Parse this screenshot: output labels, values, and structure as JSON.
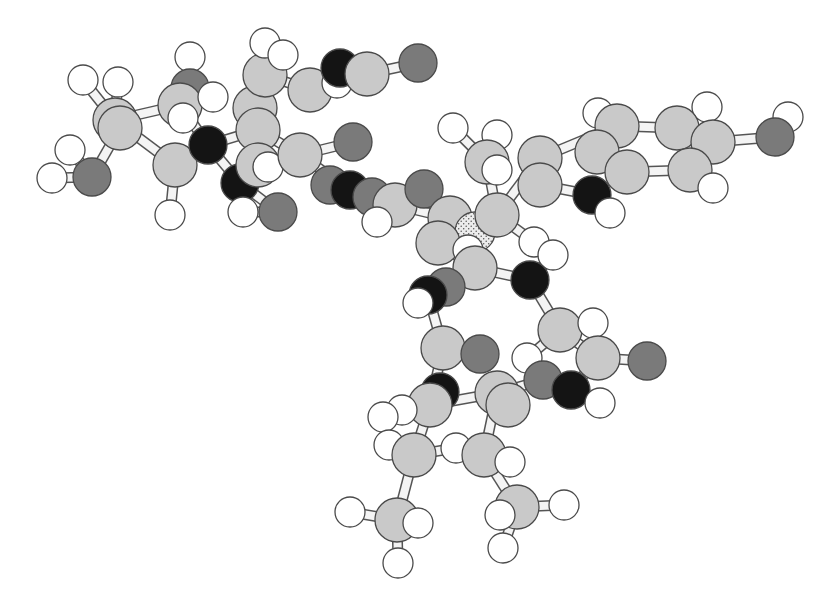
{
  "figure": {
    "type": "ball-and-stick molecular model",
    "background": "#ffffff",
    "element_styles": {
      "C": {
        "fill": "#c9c9c9",
        "r": 22,
        "label": "carbon"
      },
      "H": {
        "fill": "#ffffff",
        "r": 15,
        "label": "hydrogen"
      },
      "O": {
        "fill": "#7a7a7a",
        "r": 19,
        "label": "oxygen"
      },
      "N": {
        "fill": "#141414",
        "r": 19,
        "label": "nitrogen"
      },
      "P": {
        "fill": "#e2e2e2",
        "r": 20,
        "label": "phosphorus (stippled)",
        "pattern": "stipple"
      }
    },
    "bond_style": {
      "outer": "#555555",
      "inner": "#f4f4f4",
      "width": 11
    },
    "atoms": [
      {
        "id": 0,
        "el": "H",
        "x": 83,
        "y": 80
      },
      {
        "id": 1,
        "el": "H",
        "x": 118,
        "y": 82
      },
      {
        "id": 2,
        "el": "C",
        "x": 115,
        "y": 120
      },
      {
        "id": 3,
        "el": "C",
        "x": 120,
        "y": 128
      },
      {
        "id": 4,
        "el": "H",
        "x": 70,
        "y": 150
      },
      {
        "id": 5,
        "el": "O",
        "x": 92,
        "y": 177
      },
      {
        "id": 6,
        "el": "H",
        "x": 52,
        "y": 178
      },
      {
        "id": 7,
        "el": "C",
        "x": 175,
        "y": 165
      },
      {
        "id": 8,
        "el": "H",
        "x": 170,
        "y": 215
      },
      {
        "id": 9,
        "el": "H",
        "x": 190,
        "y": 57
      },
      {
        "id": 10,
        "el": "O",
        "x": 190,
        "y": 88
      },
      {
        "id": 11,
        "el": "C",
        "x": 180,
        "y": 105
      },
      {
        "id": 12,
        "el": "H",
        "x": 183,
        "y": 118
      },
      {
        "id": 13,
        "el": "H",
        "x": 213,
        "y": 97
      },
      {
        "id": 14,
        "el": "N",
        "x": 208,
        "y": 145
      },
      {
        "id": 15,
        "el": "N",
        "x": 240,
        "y": 183
      },
      {
        "id": 16,
        "el": "O",
        "x": 278,
        "y": 212
      },
      {
        "id": 17,
        "el": "H",
        "x": 243,
        "y": 212
      },
      {
        "id": 18,
        "el": "C",
        "x": 255,
        "y": 108
      },
      {
        "id": 19,
        "el": "C",
        "x": 258,
        "y": 130
      },
      {
        "id": 20,
        "el": "C",
        "x": 258,
        "y": 165
      },
      {
        "id": 21,
        "el": "H",
        "x": 268,
        "y": 167
      },
      {
        "id": 22,
        "el": "C",
        "x": 265,
        "y": 75
      },
      {
        "id": 23,
        "el": "H",
        "x": 265,
        "y": 43
      },
      {
        "id": 24,
        "el": "H",
        "x": 283,
        "y": 55
      },
      {
        "id": 25,
        "el": "C",
        "x": 300,
        "y": 155
      },
      {
        "id": 26,
        "el": "C",
        "x": 310,
        "y": 90
      },
      {
        "id": 27,
        "el": "H",
        "x": 337,
        "y": 83
      },
      {
        "id": 28,
        "el": "N",
        "x": 340,
        "y": 68
      },
      {
        "id": 29,
        "el": "C",
        "x": 367,
        "y": 74
      },
      {
        "id": 30,
        "el": "O",
        "x": 418,
        "y": 63
      },
      {
        "id": 31,
        "el": "O",
        "x": 353,
        "y": 142
      },
      {
        "id": 32,
        "el": "O",
        "x": 330,
        "y": 185
      },
      {
        "id": 33,
        "el": "N",
        "x": 350,
        "y": 190
      },
      {
        "id": 34,
        "el": "O",
        "x": 372,
        "y": 197
      },
      {
        "id": 35,
        "el": "C",
        "x": 395,
        "y": 205
      },
      {
        "id": 36,
        "el": "H",
        "x": 377,
        "y": 222
      },
      {
        "id": 37,
        "el": "O",
        "x": 424,
        "y": 189
      },
      {
        "id": 38,
        "el": "H",
        "x": 453,
        "y": 128
      },
      {
        "id": 39,
        "el": "H",
        "x": 497,
        "y": 135
      },
      {
        "id": 40,
        "el": "C",
        "x": 487,
        "y": 162
      },
      {
        "id": 41,
        "el": "H",
        "x": 497,
        "y": 170
      },
      {
        "id": 42,
        "el": "C",
        "x": 450,
        "y": 218
      },
      {
        "id": 43,
        "el": "P",
        "x": 475,
        "y": 232
      },
      {
        "id": 44,
        "el": "C",
        "x": 497,
        "y": 215
      },
      {
        "id": 45,
        "el": "C",
        "x": 438,
        "y": 243
      },
      {
        "id": 46,
        "el": "H",
        "x": 468,
        "y": 250
      },
      {
        "id": 47,
        "el": "C",
        "x": 475,
        "y": 268
      },
      {
        "id": 48,
        "el": "H",
        "x": 534,
        "y": 242
      },
      {
        "id": 49,
        "el": "H",
        "x": 553,
        "y": 255
      },
      {
        "id": 50,
        "el": "N",
        "x": 530,
        "y": 280
      },
      {
        "id": 51,
        "el": "O",
        "x": 446,
        "y": 287
      },
      {
        "id": 52,
        "el": "N",
        "x": 428,
        "y": 295
      },
      {
        "id": 53,
        "el": "H",
        "x": 418,
        "y": 303
      },
      {
        "id": 54,
        "el": "C",
        "x": 540,
        "y": 158
      },
      {
        "id": 55,
        "el": "C",
        "x": 540,
        "y": 185
      },
      {
        "id": 56,
        "el": "H",
        "x": 598,
        "y": 113
      },
      {
        "id": 57,
        "el": "C",
        "x": 617,
        "y": 126
      },
      {
        "id": 58,
        "el": "C",
        "x": 597,
        "y": 152
      },
      {
        "id": 59,
        "el": "C",
        "x": 627,
        "y": 172
      },
      {
        "id": 60,
        "el": "N",
        "x": 592,
        "y": 195
      },
      {
        "id": 61,
        "el": "H",
        "x": 610,
        "y": 213
      },
      {
        "id": 62,
        "el": "H",
        "x": 707,
        "y": 107
      },
      {
        "id": 63,
        "el": "C",
        "x": 677,
        "y": 128
      },
      {
        "id": 64,
        "el": "C",
        "x": 713,
        "y": 142
      },
      {
        "id": 65,
        "el": "C",
        "x": 690,
        "y": 170
      },
      {
        "id": 66,
        "el": "H",
        "x": 713,
        "y": 188
      },
      {
        "id": 67,
        "el": "H",
        "x": 788,
        "y": 117
      },
      {
        "id": 68,
        "el": "O",
        "x": 775,
        "y": 137
      },
      {
        "id": 69,
        "el": "C",
        "x": 560,
        "y": 330
      },
      {
        "id": 70,
        "el": "H",
        "x": 593,
        "y": 323
      },
      {
        "id": 71,
        "el": "H",
        "x": 527,
        "y": 358
      },
      {
        "id": 72,
        "el": "C",
        "x": 598,
        "y": 358
      },
      {
        "id": 73,
        "el": "O",
        "x": 647,
        "y": 361
      },
      {
        "id": 74,
        "el": "O",
        "x": 543,
        "y": 380
      },
      {
        "id": 75,
        "el": "N",
        "x": 571,
        "y": 390
      },
      {
        "id": 76,
        "el": "H",
        "x": 600,
        "y": 403
      },
      {
        "id": 77,
        "el": "C",
        "x": 443,
        "y": 348
      },
      {
        "id": 78,
        "el": "O",
        "x": 480,
        "y": 354
      },
      {
        "id": 79,
        "el": "N",
        "x": 440,
        "y": 392
      },
      {
        "id": 80,
        "el": "C",
        "x": 497,
        "y": 393
      },
      {
        "id": 81,
        "el": "C",
        "x": 508,
        "y": 405
      },
      {
        "id": 82,
        "el": "C",
        "x": 430,
        "y": 405
      },
      {
        "id": 83,
        "el": "H",
        "x": 402,
        "y": 410
      },
      {
        "id": 84,
        "el": "H",
        "x": 383,
        "y": 417
      },
      {
        "id": 85,
        "el": "H",
        "x": 389,
        "y": 445
      },
      {
        "id": 86,
        "el": "H",
        "x": 456,
        "y": 448
      },
      {
        "id": 87,
        "el": "C",
        "x": 414,
        "y": 455
      },
      {
        "id": 88,
        "el": "C",
        "x": 484,
        "y": 455
      },
      {
        "id": 89,
        "el": "H",
        "x": 510,
        "y": 462
      },
      {
        "id": 90,
        "el": "H",
        "x": 350,
        "y": 512
      },
      {
        "id": 91,
        "el": "C",
        "x": 397,
        "y": 520
      },
      {
        "id": 92,
        "el": "H",
        "x": 418,
        "y": 523
      },
      {
        "id": 93,
        "el": "C",
        "x": 517,
        "y": 507
      },
      {
        "id": 94,
        "el": "H",
        "x": 500,
        "y": 515
      },
      {
        "id": 95,
        "el": "H",
        "x": 564,
        "y": 505
      },
      {
        "id": 96,
        "el": "H",
        "x": 398,
        "y": 563
      },
      {
        "id": 97,
        "el": "H",
        "x": 503,
        "y": 548
      }
    ],
    "bonds": [
      [
        0,
        2
      ],
      [
        1,
        2
      ],
      [
        2,
        7
      ],
      [
        2,
        11
      ],
      [
        3,
        5
      ],
      [
        4,
        5
      ],
      [
        5,
        6
      ],
      [
        7,
        8
      ],
      [
        7,
        14
      ],
      [
        11,
        10
      ],
      [
        9,
        10
      ],
      [
        11,
        14
      ],
      [
        14,
        19
      ],
      [
        14,
        15
      ],
      [
        15,
        20
      ],
      [
        19,
        18
      ],
      [
        18,
        22
      ],
      [
        22,
        26
      ],
      [
        26,
        29
      ],
      [
        28,
        29
      ],
      [
        29,
        30
      ],
      [
        18,
        19
      ],
      [
        20,
        25
      ],
      [
        25,
        19
      ],
      [
        25,
        31
      ],
      [
        25,
        33
      ],
      [
        26,
        27
      ],
      [
        20,
        21
      ],
      [
        15,
        16
      ],
      [
        16,
        17
      ],
      [
        23,
        22
      ],
      [
        24,
        22
      ],
      [
        33,
        35
      ],
      [
        34,
        35
      ],
      [
        35,
        37
      ],
      [
        35,
        42
      ],
      [
        35,
        36
      ],
      [
        42,
        43
      ],
      [
        42,
        45
      ],
      [
        44,
        43
      ],
      [
        44,
        40
      ],
      [
        40,
        38
      ],
      [
        40,
        41
      ],
      [
        44,
        54
      ],
      [
        54,
        55
      ],
      [
        55,
        60
      ],
      [
        54,
        57
      ],
      [
        57,
        58
      ],
      [
        58,
        59
      ],
      [
        57,
        63
      ],
      [
        63,
        64
      ],
      [
        64,
        65
      ],
      [
        65,
        59
      ],
      [
        63,
        62
      ],
      [
        64,
        68
      ],
      [
        68,
        67
      ],
      [
        65,
        66
      ],
      [
        60,
        61
      ],
      [
        56,
        57
      ],
      [
        45,
        46
      ],
      [
        45,
        47
      ],
      [
        47,
        50
      ],
      [
        47,
        52
      ],
      [
        44,
        48
      ],
      [
        50,
        49
      ],
      [
        51,
        52
      ],
      [
        52,
        53
      ],
      [
        52,
        77
      ],
      [
        50,
        69
      ],
      [
        69,
        70
      ],
      [
        69,
        71
      ],
      [
        69,
        72
      ],
      [
        72,
        73
      ],
      [
        72,
        75
      ],
      [
        75,
        76
      ],
      [
        74,
        80
      ],
      [
        77,
        78
      ],
      [
        77,
        82
      ],
      [
        79,
        82
      ],
      [
        80,
        81
      ],
      [
        82,
        80
      ],
      [
        82,
        83
      ],
      [
        82,
        84
      ],
      [
        80,
        88
      ],
      [
        87,
        82
      ],
      [
        87,
        85
      ],
      [
        87,
        86
      ],
      [
        87,
        91
      ],
      [
        88,
        89
      ],
      [
        88,
        93
      ],
      [
        91,
        90
      ],
      [
        91,
        92
      ],
      [
        91,
        96
      ],
      [
        93,
        94
      ],
      [
        93,
        95
      ],
      [
        93,
        97
      ]
    ]
  }
}
